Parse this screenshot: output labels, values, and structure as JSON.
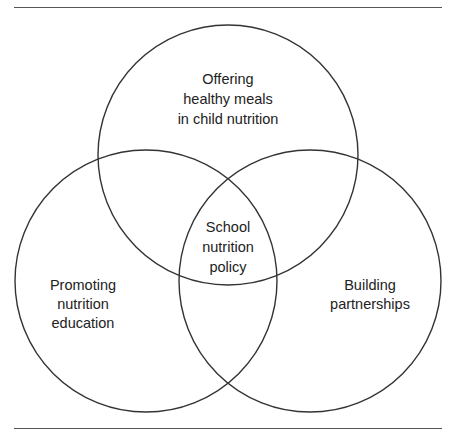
{
  "diagram": {
    "type": "venn",
    "sets": [
      {
        "id": "top",
        "lines": [
          "Offering",
          "healthy meals",
          "in child nutrition"
        ]
      },
      {
        "id": "left",
        "lines": [
          "Promoting",
          "nutrition",
          "education"
        ]
      },
      {
        "id": "right",
        "lines": [
          "Building",
          "partnerships"
        ]
      }
    ],
    "center": {
      "lines": [
        "School",
        "nutrition",
        "policy"
      ]
    },
    "colors": {
      "stroke": "#333333",
      "text": "#222222",
      "rule": "#555555"
    }
  }
}
